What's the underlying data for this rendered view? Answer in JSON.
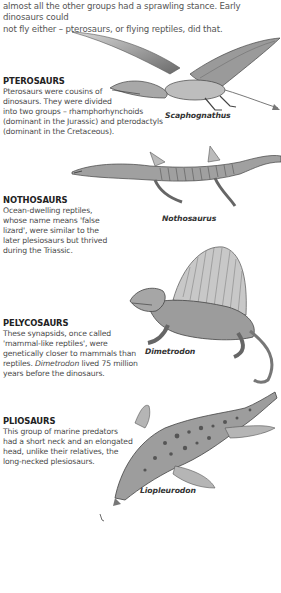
{
  "intro": {
    "line1": "almost all the other groups had a sprawling stance. Early dinosaurs could",
    "line2": "not fly either – pterosaurs, or flying reptiles, did that."
  },
  "sections": [
    {
      "heading": "PTEROSAURS",
      "lines": [
        "Pterosaurs were cousins of",
        "dinosaurs. They were divided",
        "into two groups – rhamphorhynchoids",
        "(dominant in the Jurassic) and pterodactyls",
        "(dominant in the Cretaceous)."
      ],
      "caption": "Scaphognathus",
      "illustration": "pterosaur-illustration"
    },
    {
      "heading": "NOTHOSAURS",
      "lines": [
        "Ocean-dwelling reptiles,",
        "whose name means 'false",
        "lizard', were similar to the",
        "later plesiosaurs but thrived",
        "during the Triassic."
      ],
      "caption": "Nothosaurus",
      "illustration": "nothosaur-illustration"
    },
    {
      "heading": "PELYCOSAURS",
      "lines": [
        "These synapsids, once called",
        "'mammal-like reptiles', were",
        "genetically closer to mammals than"
      ],
      "line4_pre": "reptiles. ",
      "line4_em": "Dimetrodon",
      "line4_post": " lived 75 million",
      "line5": "years before the dinosaurs.",
      "caption": "Dimetrodon",
      "illustration": "dimetrodon-illustration"
    },
    {
      "heading": "PLIOSAURS",
      "lines": [
        "This group of marine predators",
        "had a short neck and an elongated",
        "head, unlike their relatives, the",
        "long-necked plesiosaurs."
      ],
      "caption": "Liopleurodon",
      "illustration": "pliosaur-illustration"
    }
  ],
  "colors": {
    "text": "#4a4a4a",
    "heading": "#222222",
    "background": "#ffffff",
    "illustration_dark": "#3c3c3c",
    "illustration_mid": "#8a8a8a",
    "illustration_light": "#d0d0d0"
  }
}
